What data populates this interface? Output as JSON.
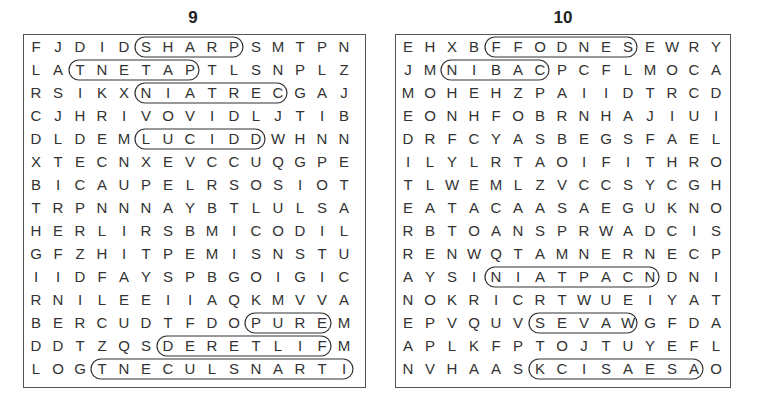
{
  "puzzles": [
    {
      "number": "9",
      "rows": [
        "FJDIDSHARPSMTPN",
        "LATNETAPTLSNPLZ",
        "RSIKXNIATRECGAJ",
        "CJHRIVOVIDLJTIB",
        "DLDEMLUCIDDWHNN",
        "XTECNXEVCCUQGPE",
        "BICAUPELRSOSIOT",
        "TRPNNNAYBTLULSA",
        "HERLIRSBMICODIL",
        "GFZHITPEMISNSTU",
        "IIDFAYSPBGOIGIC",
        "RNILEEIIAQKMVVA",
        "BERCUDTFDOPUREM",
        "DDTZQSDERETLIFM",
        "LOGTNECULSNARTI"
      ],
      "found_words_horizontal": [
        "SHARP",
        "PATENT",
        "CERTAIN",
        "LUCID",
        "PURE",
        "FILTERED",
        "TRANSLUCENT"
      ]
    },
    {
      "number": "10",
      "rows": [
        "EHXBFFODNESEWRY",
        "JMNIBACPCFLMOCA",
        "MOHEHZPAIIDTRCD",
        "EONHFOBRNHAJIUI",
        "DRFCYASBEGSFAEL",
        "ILYLRTAOIFITHRO",
        "TLWEMLZVCCSYCGH",
        "EATACAASAEGUKNO",
        "RBTOANSPRWADCIS",
        "RENWQTAMNERNECP",
        "AYSINIATPACNDNI",
        "NOKRICRTWUEIYAT",
        "EPVQUVSEVAWGFDA",
        "APLKFPTOJTUYEFL",
        "NVHAASKCISAESAO"
      ],
      "found_words_horizontal": [
        "OFFENDS",
        "CABIN",
        "PACIFIST",
        "WAVES",
        "SEASICK"
      ]
    }
  ]
}
